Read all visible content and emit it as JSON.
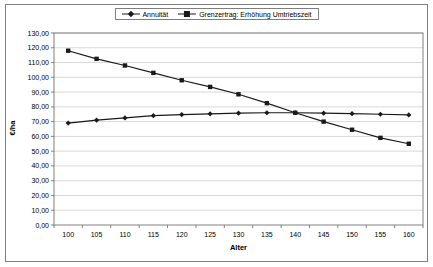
{
  "chart": {
    "colors": {
      "series": "#1a1a1a",
      "gridline": "#d9d9d9",
      "axis": "#808080",
      "frame_border": "#7f7f7f",
      "background": "#ffffff"
    }
  },
  "chart_data": {
    "type": "line",
    "title": "",
    "xlabel": "Alter",
    "ylabel": "€/ha",
    "categories": [
      100,
      105,
      110,
      115,
      120,
      125,
      130,
      135,
      140,
      145,
      150,
      155,
      160
    ],
    "series": [
      {
        "name": "Annuität",
        "marker": "diamond",
        "values": [
          69,
          71,
          72.5,
          74,
          74.8,
          75.3,
          75.7,
          76,
          76,
          75.7,
          75.4,
          75,
          74.5
        ]
      },
      {
        "name": "Grenzertrag: Erhöhung Umtriebszeit",
        "marker": "square",
        "values": [
          118,
          112.5,
          108,
          103,
          98,
          93.5,
          88.5,
          82.5,
          76,
          70,
          64.5,
          59,
          55
        ]
      }
    ],
    "ylim": [
      0,
      130
    ],
    "y_tick_step": 10,
    "y_tick_labels": [
      "0,00",
      "10,00",
      "20,00",
      "30,00",
      "40,00",
      "50,00",
      "60,00",
      "70,00",
      "80,00",
      "90,00",
      "100,00",
      "110,00",
      "120,00",
      "130,00"
    ],
    "grid": true,
    "legend_position": "top-center",
    "marker_color": "#1a1a1a"
  }
}
